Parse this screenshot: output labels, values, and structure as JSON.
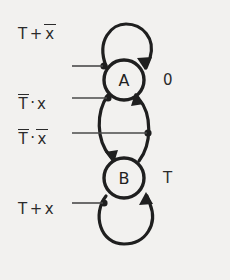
{
  "diagram": {
    "type": "state-transition-diagram",
    "title": "",
    "background_color": "#f2f1ef",
    "ink_color": "#1f1f1f",
    "states": [
      {
        "id": "A",
        "label": "A",
        "output_label": "0",
        "center": [
          124,
          80
        ],
        "radius": 20
      },
      {
        "id": "B",
        "label": "B",
        "output_label": "T",
        "center": [
          124,
          178
        ],
        "radius": 20
      }
    ],
    "transitions": [
      {
        "id": "self-loop-a",
        "from": "A",
        "to": "A",
        "condition_text": "T + x̄",
        "condition_parts": [
          {
            "text": "T",
            "overbar": false
          },
          {
            "text": "+",
            "overbar": false,
            "operator": true
          },
          {
            "text": "x",
            "overbar": true
          }
        ],
        "label_position": [
          18,
          28
        ]
      },
      {
        "id": "a-to-b",
        "from": "A",
        "to": "B",
        "condition_text": "T̄ · x",
        "condition_parts": [
          {
            "text": "T",
            "overbar": true
          },
          {
            "text": "·",
            "overbar": false,
            "operator": true
          },
          {
            "text": "x",
            "overbar": false
          }
        ],
        "label_position": [
          18,
          98
        ]
      },
      {
        "id": "b-to-a",
        "from": "B",
        "to": "A",
        "condition_text": "T̄ · x̄",
        "condition_parts": [
          {
            "text": "T",
            "overbar": true
          },
          {
            "text": "·",
            "overbar": false,
            "operator": true
          },
          {
            "text": "x",
            "overbar": true
          }
        ],
        "label_position": [
          18,
          133
        ]
      },
      {
        "id": "self-loop-b",
        "from": "B",
        "to": "B",
        "condition_text": "T + x",
        "condition_parts": [
          {
            "text": "T",
            "overbar": false
          },
          {
            "text": "+",
            "overbar": false,
            "operator": true
          },
          {
            "text": "x",
            "overbar": false
          }
        ],
        "label_position": [
          18,
          203
        ]
      }
    ],
    "outputs": [
      {
        "state": "A",
        "value": "0",
        "position": [
          163,
          73
        ]
      },
      {
        "state": "B",
        "value": "T",
        "position": [
          163,
          171
        ]
      }
    ]
  }
}
